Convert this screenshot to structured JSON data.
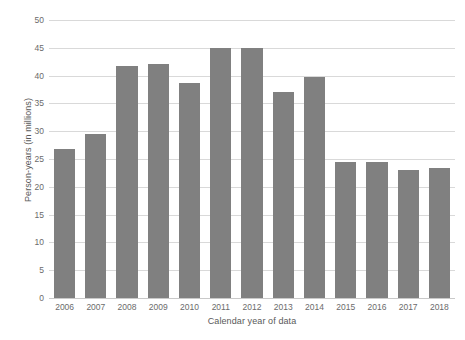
{
  "chart_data": {
    "type": "bar",
    "title": "",
    "subtitle": "",
    "xlabel": "Calendar year of data",
    "ylabel": "Person-years (in millions)",
    "categories": [
      "2006",
      "2007",
      "2008",
      "2009",
      "2010",
      "2011",
      "2012",
      "2013",
      "2014",
      "2015",
      "2016",
      "2017",
      "2018"
    ],
    "values": [
      26.8,
      29.5,
      41.7,
      42.1,
      38.6,
      45.0,
      45.0,
      37.0,
      39.7,
      24.5,
      24.5,
      23.0,
      23.4
    ],
    "series": [
      {
        "name": "Person-years",
        "values": [
          26.8,
          29.5,
          41.7,
          42.1,
          38.6,
          45.0,
          45.0,
          37.0,
          39.7,
          24.5,
          24.5,
          23.0,
          23.4
        ]
      }
    ],
    "ylim": [
      0,
      50
    ],
    "ytick_values": [
      0,
      5,
      10,
      15,
      20,
      25,
      30,
      35,
      40,
      45,
      50
    ],
    "ytick_labels": [
      "0",
      "5",
      "10",
      "15",
      "20",
      "25",
      "30",
      "35",
      "40",
      "45",
      "50"
    ],
    "grid": true,
    "grid_axis": "y",
    "legend": false,
    "legend_position": "none",
    "bar_color": "#808080",
    "gridline_color": "#d9d9d9",
    "background_color": "#ffffff",
    "axis_text_color": "#6b6b6b",
    "axis_title_color": "#595959",
    "annotations": []
  }
}
